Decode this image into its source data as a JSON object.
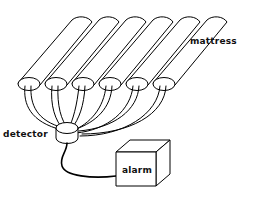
{
  "figure": {
    "background_color": "#ffffff",
    "ink_color": "#000000",
    "width": 253,
    "height": 203
  },
  "labels": {
    "mattress": "mattress",
    "detector": "detector",
    "alarm": "alarm"
  },
  "caption": {
    "clipped_line": "a maan tha anmnaa  aannat han a ann nd flan"
  },
  "components": {
    "mattress": {
      "name": "mattress",
      "tube_count": 6,
      "description": "six parallel rounded tubes drawn in diagonal perspective"
    },
    "tube_caps": {
      "name": "tube-end-caps",
      "count": 6,
      "shape": "ellipse"
    },
    "wires": {
      "name": "sensor-wires",
      "count": 6,
      "description": "wire pairs arcing from each tube cap down to the detector"
    },
    "detector": {
      "name": "detector",
      "shape": "cylinder-puck"
    },
    "alarm": {
      "name": "alarm",
      "shape": "cube"
    },
    "cable": {
      "name": "detector-to-alarm-cable",
      "description": "single curved cable from detector to alarm box"
    }
  }
}
